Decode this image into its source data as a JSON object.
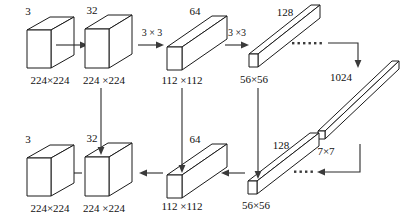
{
  "figure": {
    "type": "neural-network-architecture-diagram",
    "title": "",
    "background_color": "#ffffff",
    "line_color": "#1a1a1a",
    "text_color": "#111111"
  },
  "encoder": {
    "label": "encoder-path",
    "blocks": [
      {
        "id": "enc-input",
        "channels": "3",
        "spatial": "224×224",
        "shape": "cube"
      },
      {
        "id": "enc-32",
        "channels": "32",
        "spatial": "224 ×224",
        "shape": "cube"
      },
      {
        "id": "enc-64",
        "channels": "64",
        "spatial": "112 ×112",
        "shape": "bar"
      },
      {
        "id": "enc-128",
        "channels": "128",
        "spatial": "56×56",
        "shape": "long-bar"
      }
    ],
    "kernels": [
      {
        "id": "enc-k1",
        "label": "3 × 3"
      },
      {
        "id": "enc-k2",
        "label": "3 ×3"
      }
    ],
    "ellipsis": "······"
  },
  "bottleneck": {
    "label": "bottleneck",
    "channels": "1024",
    "spatial": "7×7",
    "shape": "thin-bar"
  },
  "decoder": {
    "label": "decoder-path",
    "blocks": [
      {
        "id": "dec-128",
        "channels": "128",
        "spatial": "56×56",
        "shape": "long-bar"
      },
      {
        "id": "dec-64",
        "channels": "64",
        "spatial": "112 ×112",
        "shape": "bar"
      },
      {
        "id": "dec-32",
        "channels": "32",
        "spatial": "224 ×224",
        "shape": "cube"
      },
      {
        "id": "dec-out",
        "channels": "3",
        "spatial": "224×224",
        "shape": "cube"
      }
    ],
    "ellipsis": "······"
  },
  "skip_connections": [
    {
      "id": "skip-32",
      "from": "enc-32",
      "to": "dec-32"
    },
    {
      "id": "skip-64",
      "from": "enc-64",
      "to": "dec-64"
    },
    {
      "id": "skip-128",
      "from": "enc-128",
      "to": "dec-128"
    }
  ]
}
